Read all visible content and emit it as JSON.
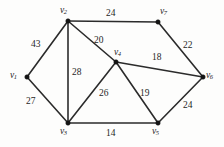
{
  "figure": {
    "background_color": "#fdfdfc",
    "edge_color": "#2b2b2b",
    "vertex_color": "#141414",
    "text_color": "#1c1c1c"
  },
  "vertices": [
    {
      "id": "v1",
      "name": "v",
      "sub": "1",
      "x": 27,
      "y": 77,
      "label_x": 10,
      "label_y": 71
    },
    {
      "id": "v2",
      "name": "v",
      "sub": "2",
      "x": 68,
      "y": 21,
      "label_x": 60,
      "label_y": 6
    },
    {
      "id": "v3",
      "name": "v",
      "sub": "3",
      "x": 68,
      "y": 123,
      "label_x": 60,
      "label_y": 127
    },
    {
      "id": "v4",
      "name": "v",
      "sub": "4",
      "x": 116,
      "y": 62,
      "label_x": 114,
      "label_y": 48
    },
    {
      "id": "v5",
      "name": "v",
      "sub": "5",
      "x": 158,
      "y": 123,
      "label_x": 152,
      "label_y": 127
    },
    {
      "id": "v6",
      "name": "v",
      "sub": "6",
      "x": 203,
      "y": 77,
      "label_x": 206,
      "label_y": 71
    },
    {
      "id": "v7",
      "name": "v",
      "sub": "7",
      "x": 158,
      "y": 22,
      "label_x": 160,
      "label_y": 7
    }
  ],
  "edges": [
    {
      "id": "e-v1-v2",
      "from": "v1",
      "to": "v2",
      "weight": "43",
      "label_x": 31,
      "label_y": 40
    },
    {
      "id": "e-v1-v3",
      "from": "v1",
      "to": "v3",
      "weight": "27",
      "label_x": 26,
      "label_y": 97
    },
    {
      "id": "e-v2-v3",
      "from": "v2",
      "to": "v3",
      "weight": "28",
      "label_x": 72,
      "label_y": 68
    },
    {
      "id": "e-v2-v4",
      "from": "v2",
      "to": "v4",
      "weight": "20",
      "label_x": 94,
      "label_y": 36
    },
    {
      "id": "e-v2-v7",
      "from": "v2",
      "to": "v7",
      "weight": "24",
      "label_x": 106,
      "label_y": 9
    },
    {
      "id": "e-v3-v4",
      "from": "v3",
      "to": "v4",
      "weight": "26",
      "label_x": 99,
      "label_y": 89
    },
    {
      "id": "e-v3-v5",
      "from": "v3",
      "to": "v5",
      "weight": "14",
      "label_x": 106,
      "label_y": 129
    },
    {
      "id": "e-v4-v5",
      "from": "v4",
      "to": "v5",
      "weight": "19",
      "label_x": 140,
      "label_y": 89
    },
    {
      "id": "e-v4-v6",
      "from": "v4",
      "to": "v6",
      "weight": "18",
      "label_x": 152,
      "label_y": 53
    },
    {
      "id": "e-v5-v6",
      "from": "v5",
      "to": "v6",
      "weight": "24",
      "label_x": 183,
      "label_y": 101
    },
    {
      "id": "e-v6-v7",
      "from": "v6",
      "to": "v7",
      "weight": "22",
      "label_x": 183,
      "label_y": 41
    }
  ],
  "chart_data": {
    "type": "diagram",
    "diagram_kind": "weighted-undirected-graph",
    "title": "",
    "node_labels": [
      "v1",
      "v2",
      "v3",
      "v4",
      "v5",
      "v6",
      "v7"
    ],
    "node_count": 7,
    "edge_count": 11,
    "edge_list": [
      [
        "v1",
        "v2",
        43
      ],
      [
        "v1",
        "v3",
        27
      ],
      [
        "v2",
        "v3",
        28
      ],
      [
        "v2",
        "v4",
        20
      ],
      [
        "v2",
        "v7",
        24
      ],
      [
        "v3",
        "v4",
        26
      ],
      [
        "v3",
        "v5",
        14
      ],
      [
        "v4",
        "v5",
        19
      ],
      [
        "v4",
        "v6",
        18
      ],
      [
        "v5",
        "v6",
        24
      ],
      [
        "v6",
        "v7",
        22
      ]
    ],
    "node_positions": {
      "v1": [
        27,
        77
      ],
      "v2": [
        68,
        21
      ],
      "v3": [
        68,
        123
      ],
      "v4": [
        116,
        62
      ],
      "v5": [
        158,
        123
      ],
      "v6": [
        203,
        77
      ],
      "v7": [
        158,
        22
      ]
    },
    "weights": [
      43,
      27,
      28,
      20,
      24,
      26,
      14,
      19,
      18,
      24,
      22
    ],
    "directed": false,
    "weighted": true
  }
}
